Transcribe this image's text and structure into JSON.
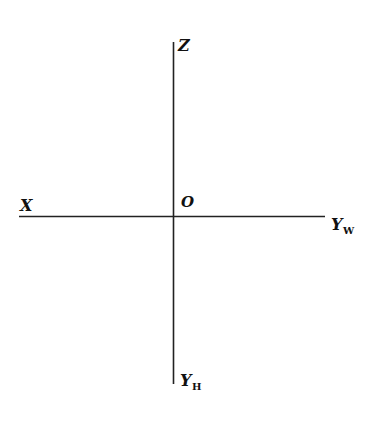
{
  "diagram": {
    "type": "coordinate-axes",
    "stroke_color": "#222222",
    "text_color": "#111111",
    "labels": {
      "z": {
        "main": "Z",
        "sub": ""
      },
      "origin": {
        "main": "O",
        "sub": ""
      },
      "x": {
        "main": "X",
        "sub": ""
      },
      "yw": {
        "main": "Y",
        "sub": "W"
      },
      "yh": {
        "main": "Y",
        "sub": "H"
      }
    }
  }
}
